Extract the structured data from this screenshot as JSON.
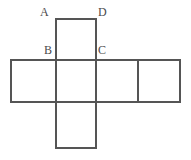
{
  "figure": {
    "kind": "cube-net-diagram",
    "stroke_color": "#555555",
    "background_color": "#ffffff",
    "stroke_width": 1.2,
    "square_size_px": 42,
    "labels": [
      {
        "id": "A",
        "text": "A",
        "x": 56,
        "y": 19,
        "anchor": "top-left-of-top-square"
      },
      {
        "id": "D",
        "text": "D",
        "x": 96,
        "y": 19,
        "anchor": "top-right-of-top-square"
      },
      {
        "id": "B",
        "text": "B",
        "x": 56,
        "y": 60,
        "anchor": "bottom-left-of-top-square"
      },
      {
        "id": "C",
        "text": "C",
        "x": 96,
        "y": 60,
        "anchor": "bottom-right-of-top-square"
      }
    ],
    "squares": [
      {
        "name": "top-square",
        "x": 56,
        "y": 19,
        "w": 40,
        "h": 41
      },
      {
        "name": "row-square-1-left",
        "x": 11,
        "y": 60,
        "w": 45,
        "h": 42
      },
      {
        "name": "row-square-2-center",
        "x": 56,
        "y": 60,
        "w": 40,
        "h": 42
      },
      {
        "name": "row-square-3",
        "x": 96,
        "y": 60,
        "w": 42,
        "h": 42
      },
      {
        "name": "row-square-4-right",
        "x": 138,
        "y": 60,
        "w": 42,
        "h": 42
      },
      {
        "name": "bottom-square",
        "x": 56,
        "y": 102,
        "w": 40,
        "h": 46
      }
    ],
    "segments": [
      {
        "name": "top-square-top-edge",
        "x1": 56,
        "y1": 19,
        "x2": 96,
        "y2": 19
      },
      {
        "name": "top-square-left-edge",
        "x1": 56,
        "y1": 19,
        "x2": 56,
        "y2": 60
      },
      {
        "name": "top-square-right-edge",
        "x1": 96,
        "y1": 19,
        "x2": 96,
        "y2": 60
      },
      {
        "name": "row-top-edge",
        "x1": 11,
        "y1": 60,
        "x2": 180,
        "y2": 60
      },
      {
        "name": "row-bottom-edge",
        "x1": 11,
        "y1": 102,
        "x2": 180,
        "y2": 102
      },
      {
        "name": "row-left-edge",
        "x1": 11,
        "y1": 60,
        "x2": 11,
        "y2": 102
      },
      {
        "name": "row-right-edge",
        "x1": 180,
        "y1": 60,
        "x2": 180,
        "y2": 102
      },
      {
        "name": "column-left-edge",
        "x1": 56,
        "y1": 60,
        "x2": 56,
        "y2": 148
      },
      {
        "name": "column-right-edge",
        "x1": 96,
        "y1": 60,
        "x2": 96,
        "y2": 148
      },
      {
        "name": "row-divider-3-4",
        "x1": 138,
        "y1": 60,
        "x2": 138,
        "y2": 102
      },
      {
        "name": "bottom-square-bottom-edge",
        "x1": 56,
        "y1": 148,
        "x2": 96,
        "y2": 148
      }
    ]
  }
}
